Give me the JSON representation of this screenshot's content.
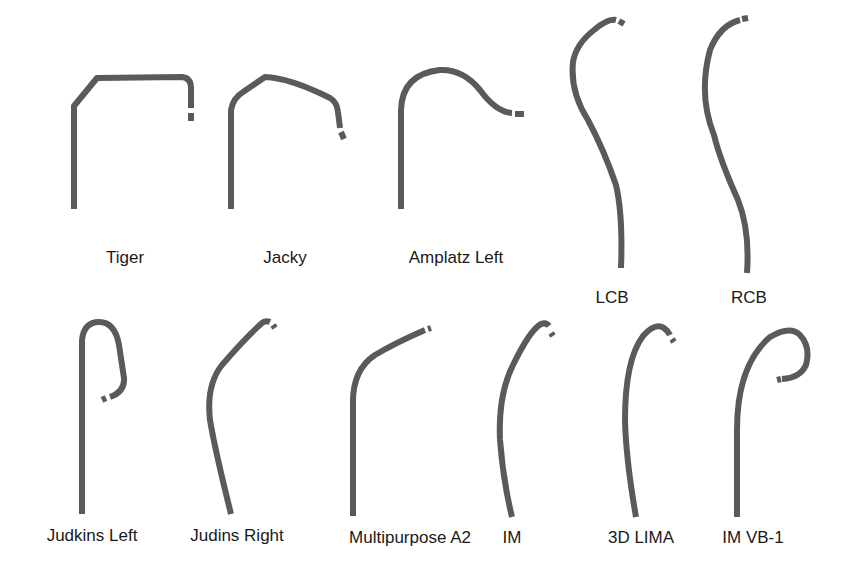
{
  "figure": {
    "stroke_color": "#5a5a5a",
    "background": "#ffffff",
    "catheters": [
      {
        "id": "tiger",
        "label": "Tiger",
        "label_x": 125,
        "label_y": 249
      },
      {
        "id": "jacky",
        "label": "Jacky",
        "label_x": 285,
        "label_y": 249
      },
      {
        "id": "amplatz-left",
        "label": "Amplatz Left",
        "label_x": 456,
        "label_y": 249
      },
      {
        "id": "lcb",
        "label": "LCB",
        "label_x": 612,
        "label_y": 289
      },
      {
        "id": "rcb",
        "label": "RCB",
        "label_x": 749,
        "label_y": 289
      },
      {
        "id": "judkins-left",
        "label": "Judkins Left",
        "label_x": 92,
        "label_y": 527
      },
      {
        "id": "judins-right",
        "label": "Judins Right",
        "label_x": 237,
        "label_y": 527
      },
      {
        "id": "multipurpose-a2",
        "label": "Multipurpose A2",
        "label_x": 410,
        "label_y": 529
      },
      {
        "id": "im",
        "label": "IM",
        "label_x": 512,
        "label_y": 529
      },
      {
        "id": "3d-lima",
        "label": "3D LIMA",
        "label_x": 641,
        "label_y": 529
      },
      {
        "id": "im-vb-1",
        "label": "IM VB-1",
        "label_x": 753,
        "label_y": 529
      }
    ]
  }
}
